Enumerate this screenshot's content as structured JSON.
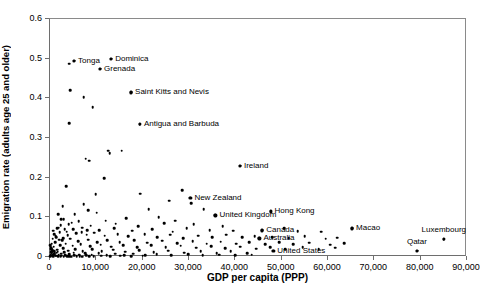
{
  "chart_data": {
    "type": "scatter",
    "title": "",
    "xlabel": "GDP per capita (PPP)",
    "ylabel": "Emigration rate (adults age 25 and older)",
    "xlim": [
      0,
      90000
    ],
    "ylim": [
      0,
      0.6
    ],
    "xticks": [
      0,
      10000,
      20000,
      30000,
      40000,
      50000,
      60000,
      70000,
      80000,
      90000
    ],
    "xtick_labels": [
      "0",
      "10,000",
      "20,000",
      "30,000",
      "40,000",
      "50,000",
      "60,000",
      "70,000",
      "80,000",
      "90,000"
    ],
    "yticks": [
      0,
      0.1,
      0.2,
      0.3,
      0.4,
      0.5,
      0.6
    ],
    "ytick_labels": [
      "0",
      "0.1",
      "0.2",
      "0.3",
      "0.4",
      "0.5",
      "0.6"
    ],
    "grid": false,
    "legend": "none",
    "marker_color": "#000000",
    "axis_color": "#6e6e6e",
    "labeled_points": [
      {
        "name": "Tonga",
        "x": 5200,
        "y": 0.495,
        "label_pos": "left"
      },
      {
        "name": "Dominica",
        "x": 13200,
        "y": 0.5,
        "label_pos": "left"
      },
      {
        "name": "Grenada",
        "x": 10800,
        "y": 0.475,
        "label_pos": "left"
      },
      {
        "name": "Saint Kitts and Nevis",
        "x": 17500,
        "y": 0.415,
        "label_pos": "left"
      },
      {
        "name": "Antigua and Barbuda",
        "x": 19400,
        "y": 0.335,
        "label_pos": "left"
      },
      {
        "name": "Ireland",
        "x": 41000,
        "y": 0.23,
        "label_pos": "left"
      },
      {
        "name": "New Zealand",
        "x": 30300,
        "y": 0.15,
        "label_pos": "left"
      },
      {
        "name": "United Kingdom",
        "x": 35700,
        "y": 0.105,
        "label_pos": "left"
      },
      {
        "name": "Hong Kong",
        "x": 47600,
        "y": 0.115,
        "label_pos": "left"
      },
      {
        "name": "Canada",
        "x": 45800,
        "y": 0.067,
        "label_pos": "left"
      },
      {
        "name": "Australia",
        "x": 45200,
        "y": 0.047,
        "label_pos": "left"
      },
      {
        "name": "United States",
        "x": 48200,
        "y": 0.016,
        "label_pos": "left"
      },
      {
        "name": "Macao",
        "x": 65200,
        "y": 0.072,
        "label_pos": "left"
      },
      {
        "name": "Luxembourg",
        "x": 85000,
        "y": 0.045,
        "label_pos": "above"
      },
      {
        "name": "Qatar",
        "x": 79200,
        "y": 0.016,
        "label_pos": "above"
      }
    ],
    "points": [
      [
        4200,
        0.487
      ],
      [
        5200,
        0.495
      ],
      [
        13200,
        0.5
      ],
      [
        10800,
        0.475
      ],
      [
        4300,
        0.42
      ],
      [
        7300,
        0.403
      ],
      [
        9200,
        0.377
      ],
      [
        17500,
        0.415
      ],
      [
        4200,
        0.338
      ],
      [
        19400,
        0.335
      ],
      [
        12500,
        0.268
      ],
      [
        12900,
        0.262
      ],
      [
        15500,
        0.268
      ],
      [
        8500,
        0.243
      ],
      [
        41000,
        0.23
      ],
      [
        7700,
        0.248
      ],
      [
        3500,
        0.178
      ],
      [
        11700,
        0.198
      ],
      [
        9900,
        0.158
      ],
      [
        19500,
        0.16
      ],
      [
        28500,
        0.168
      ],
      [
        30300,
        0.15
      ],
      [
        2700,
        0.128
      ],
      [
        7300,
        0.133
      ],
      [
        25700,
        0.142
      ],
      [
        8300,
        0.118
      ],
      [
        30500,
        0.135
      ],
      [
        1800,
        0.108
      ],
      [
        5300,
        0.108
      ],
      [
        10100,
        0.112
      ],
      [
        21300,
        0.12
      ],
      [
        33200,
        0.12
      ],
      [
        35700,
        0.105
      ],
      [
        47600,
        0.115
      ],
      [
        2400,
        0.096
      ],
      [
        6200,
        0.09
      ],
      [
        12000,
        0.092
      ],
      [
        16500,
        0.098
      ],
      [
        23500,
        0.1
      ],
      [
        27000,
        0.092
      ],
      [
        4000,
        0.082
      ],
      [
        8800,
        0.079
      ],
      [
        14200,
        0.084
      ],
      [
        19000,
        0.078
      ],
      [
        24600,
        0.085
      ],
      [
        31000,
        0.082
      ],
      [
        37300,
        0.078
      ],
      [
        1500,
        0.072
      ],
      [
        3200,
        0.07
      ],
      [
        6900,
        0.074
      ],
      [
        10600,
        0.068
      ],
      [
        13800,
        0.072
      ],
      [
        17800,
        0.066
      ],
      [
        22000,
        0.07
      ],
      [
        26500,
        0.064
      ],
      [
        29500,
        0.072
      ],
      [
        34500,
        0.068
      ],
      [
        39500,
        0.066
      ],
      [
        45800,
        0.067
      ],
      [
        50500,
        0.072
      ],
      [
        53500,
        0.065
      ],
      [
        58500,
        0.064
      ],
      [
        65200,
        0.072
      ],
      [
        85000,
        0.045
      ],
      [
        900,
        0.058
      ],
      [
        2100,
        0.062
      ],
      [
        3800,
        0.055
      ],
      [
        5600,
        0.06
      ],
      [
        7900,
        0.056
      ],
      [
        9600,
        0.061
      ],
      [
        11800,
        0.054
      ],
      [
        14600,
        0.058
      ],
      [
        16900,
        0.052
      ],
      [
        20400,
        0.058
      ],
      [
        23200,
        0.05
      ],
      [
        26000,
        0.056
      ],
      [
        28800,
        0.048
      ],
      [
        32000,
        0.054
      ],
      [
        35000,
        0.05
      ],
      [
        38000,
        0.056
      ],
      [
        41500,
        0.05
      ],
      [
        44200,
        0.052
      ],
      [
        45200,
        0.047
      ],
      [
        48000,
        0.05
      ],
      [
        51500,
        0.048
      ],
      [
        55000,
        0.052
      ],
      [
        59500,
        0.046
      ],
      [
        62000,
        0.049
      ],
      [
        600,
        0.046
      ],
      [
        1400,
        0.05
      ],
      [
        2600,
        0.042
      ],
      [
        4400,
        0.046
      ],
      [
        6100,
        0.04
      ],
      [
        8200,
        0.044
      ],
      [
        10200,
        0.038
      ],
      [
        12300,
        0.043
      ],
      [
        15000,
        0.037
      ],
      [
        18200,
        0.042
      ],
      [
        21000,
        0.036
      ],
      [
        24200,
        0.041
      ],
      [
        27500,
        0.035
      ],
      [
        30800,
        0.04
      ],
      [
        33800,
        0.034
      ],
      [
        36800,
        0.039
      ],
      [
        40200,
        0.034
      ],
      [
        43000,
        0.038
      ],
      [
        46500,
        0.033
      ],
      [
        49500,
        0.037
      ],
      [
        52500,
        0.032
      ],
      [
        56000,
        0.036
      ],
      [
        60500,
        0.031
      ],
      [
        63500,
        0.035
      ],
      [
        400,
        0.034
      ],
      [
        1100,
        0.038
      ],
      [
        2200,
        0.03
      ],
      [
        3400,
        0.034
      ],
      [
        4900,
        0.028
      ],
      [
        6600,
        0.032
      ],
      [
        8700,
        0.027
      ],
      [
        10900,
        0.031
      ],
      [
        13200,
        0.026
      ],
      [
        15800,
        0.03
      ],
      [
        18800,
        0.025
      ],
      [
        21800,
        0.029
      ],
      [
        25000,
        0.024
      ],
      [
        28200,
        0.028
      ],
      [
        31500,
        0.023
      ],
      [
        34800,
        0.027
      ],
      [
        37800,
        0.022
      ],
      [
        41000,
        0.026
      ],
      [
        44500,
        0.021
      ],
      [
        47500,
        0.025
      ],
      [
        50800,
        0.02
      ],
      [
        54500,
        0.024
      ],
      [
        58000,
        0.019
      ],
      [
        61500,
        0.023
      ],
      [
        300,
        0.022
      ],
      [
        800,
        0.026
      ],
      [
        1600,
        0.018
      ],
      [
        2800,
        0.022
      ],
      [
        3900,
        0.016
      ],
      [
        5400,
        0.02
      ],
      [
        7100,
        0.015
      ],
      [
        9100,
        0.019
      ],
      [
        11200,
        0.014
      ],
      [
        13600,
        0.018
      ],
      [
        16200,
        0.013
      ],
      [
        19200,
        0.017
      ],
      [
        22400,
        0.012
      ],
      [
        25500,
        0.016
      ],
      [
        29000,
        0.011
      ],
      [
        32500,
        0.015
      ],
      [
        36000,
        0.01
      ],
      [
        39000,
        0.014
      ],
      [
        42500,
        0.01
      ],
      [
        48200,
        0.016
      ],
      [
        79200,
        0.016
      ],
      [
        200,
        0.012
      ],
      [
        500,
        0.015
      ],
      [
        1000,
        0.009
      ],
      [
        1700,
        0.013
      ],
      [
        2400,
        0.008
      ],
      [
        3100,
        0.012
      ],
      [
        4100,
        0.007
      ],
      [
        5100,
        0.011
      ],
      [
        6300,
        0.006
      ],
      [
        7600,
        0.01
      ],
      [
        9000,
        0.006
      ],
      [
        10500,
        0.009
      ],
      [
        12200,
        0.005
      ],
      [
        14100,
        0.008
      ],
      [
        16000,
        0.005
      ],
      [
        18000,
        0.008
      ],
      [
        20500,
        0.004
      ],
      [
        23000,
        0.007
      ],
      [
        26200,
        0.004
      ],
      [
        29800,
        0.007
      ],
      [
        33000,
        0.004
      ],
      [
        36500,
        0.006
      ],
      [
        40000,
        0.004
      ],
      [
        43500,
        0.006
      ],
      [
        150,
        0.006
      ],
      [
        350,
        0.009
      ],
      [
        650,
        0.004
      ],
      [
        950,
        0.007
      ],
      [
        1300,
        0.003
      ],
      [
        1900,
        0.006
      ],
      [
        2500,
        0.003
      ],
      [
        3300,
        0.005
      ],
      [
        4200,
        0.002
      ],
      [
        5200,
        0.004
      ],
      [
        6400,
        0.002
      ],
      [
        7800,
        0.004
      ],
      [
        9400,
        0.002
      ],
      [
        11000,
        0.003
      ],
      [
        13000,
        0.002
      ],
      [
        15200,
        0.003
      ],
      [
        17500,
        0.002
      ],
      [
        20000,
        0.003
      ],
      [
        100,
        0.002
      ],
      [
        450,
        0.003
      ],
      [
        750,
        0.002
      ],
      [
        1200,
        0.003
      ],
      [
        1750,
        0.002
      ],
      [
        2300,
        0.002
      ],
      [
        3000,
        0.001
      ],
      [
        3700,
        0.002
      ],
      [
        4600,
        0.001
      ],
      [
        5800,
        0.002
      ],
      [
        7000,
        0.001
      ],
      [
        8400,
        0.002
      ],
      [
        50,
        0.03
      ],
      [
        120,
        0.026
      ],
      [
        250,
        0.02
      ],
      [
        600,
        0.017
      ],
      [
        900,
        0.014
      ],
      [
        1450,
        0.011
      ],
      [
        2000,
        0.044
      ],
      [
        2900,
        0.048
      ],
      [
        1250,
        0.052
      ],
      [
        700,
        0.066
      ],
      [
        1850,
        0.074
      ],
      [
        3600,
        0.064
      ],
      [
        5000,
        0.07
      ],
      [
        6800,
        0.062
      ],
      [
        8000,
        0.068
      ],
      [
        4700,
        0.086
      ],
      [
        2300,
        0.08
      ],
      [
        3000,
        0.095
      ]
    ]
  }
}
